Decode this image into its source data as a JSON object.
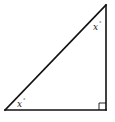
{
  "diagram": {
    "type": "right-triangle",
    "vertices": {
      "top": {
        "x": 106,
        "y": 5
      },
      "bottom_left": {
        "x": 5,
        "y": 110
      },
      "bottom_right": {
        "x": 106,
        "y": 110
      }
    },
    "right_angle_at": "bottom_right",
    "angle_labels": [
      {
        "vertex": "top",
        "variable": "x",
        "unit": "°"
      },
      {
        "vertex": "bottom_left",
        "variable": "x",
        "unit": "°"
      }
    ],
    "colors": {
      "stroke": "#111111",
      "background": "#ffffff"
    }
  }
}
